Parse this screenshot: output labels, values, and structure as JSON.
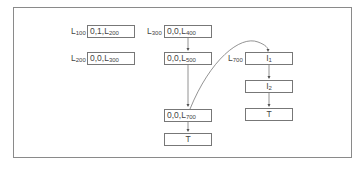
{
  "diagram": {
    "type": "linked-structure",
    "left_column": [
      {
        "label_main": "L",
        "label_sub": "100",
        "text": "0,1,L",
        "text_sub": "200"
      },
      {
        "label_main": "L",
        "label_sub": "200",
        "text": "0,0,L",
        "text_sub": "300"
      }
    ],
    "middle_column": [
      {
        "label_main": "L",
        "label_sub": "300",
        "text": "0,0,L",
        "text_sub": "400"
      },
      {
        "label_main": "",
        "label_sub": "",
        "text": "0,0,L",
        "text_sub": "500"
      },
      {
        "label_main": "",
        "label_sub": "",
        "text": "0,0,L",
        "text_sub": "700"
      },
      {
        "label_main": "",
        "label_sub": "",
        "text": "T",
        "text_sub": ""
      }
    ],
    "right_column": [
      {
        "label_main": "L",
        "label_sub": "700",
        "text": "I",
        "text_sub": "1"
      },
      {
        "label_main": "",
        "label_sub": "",
        "text": "I",
        "text_sub": "2"
      },
      {
        "label_main": "",
        "label_sub": "",
        "text": "T",
        "text_sub": ""
      }
    ],
    "edges": [
      {
        "from": "L300 box",
        "to": "L500 box",
        "style": "arrow"
      },
      {
        "from": "L500 box",
        "to": "L700 box",
        "style": "arrow"
      },
      {
        "from": "L700 box",
        "to": "T box (middle)",
        "style": "arrow"
      },
      {
        "from": "L700 box",
        "to": "I1 box",
        "style": "curved-arrow"
      },
      {
        "from": "I1 box",
        "to": "I2 box",
        "style": "arrow"
      },
      {
        "from": "I2 box",
        "to": "T box (right)",
        "style": "arrow"
      }
    ],
    "colors": {
      "line": "#777777",
      "text": "#444444",
      "background": "#ffffff"
    }
  }
}
